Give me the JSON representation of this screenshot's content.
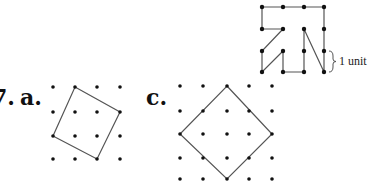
{
  "labels": {
    "problem_number_fragment": "7.",
    "part_a": "a.",
    "part_c": "c.",
    "unit_annotation": "1 unit"
  },
  "figures": {
    "top_path": {
      "description": "Path drawn on 4x4 dot grid",
      "grid_cols": 4,
      "grid_rows": 4
    },
    "part_a": {
      "description": "Tilted square on 4x4 dot grid",
      "grid_cols": 4,
      "grid_rows": 4,
      "vertices": [
        [
          1,
          0
        ],
        [
          3,
          1
        ],
        [
          2,
          3
        ],
        [
          0,
          2
        ]
      ]
    },
    "part_c": {
      "description": "Diamond (square rotated 45°) on 5x5 dot grid",
      "grid_cols": 5,
      "grid_rows": 5,
      "vertices": [
        [
          2,
          0
        ],
        [
          4,
          2
        ],
        [
          2,
          4
        ],
        [
          0,
          2
        ]
      ]
    }
  },
  "colors": {
    "line": "#555555",
    "dot": "#111111",
    "text": "#111111"
  }
}
